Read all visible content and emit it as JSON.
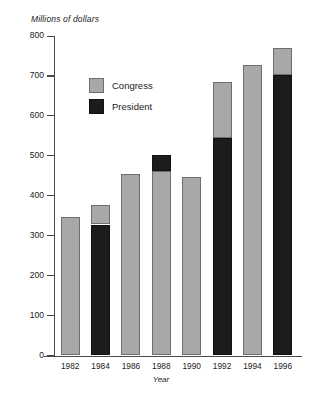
{
  "chart_data": {
    "type": "bar",
    "title": "",
    "subtitle": "",
    "xlabel": "Year",
    "ylabel": "Millions of dollars",
    "ylim": [
      0,
      800
    ],
    "ytick_step": 100,
    "yticks": [
      "800",
      "700",
      "600",
      "500",
      "400",
      "300",
      "200",
      "100",
      "0"
    ],
    "categories": [
      "1982",
      "1984",
      "1986",
      "1988",
      "1990",
      "1992",
      "1994",
      "1996"
    ],
    "stacked": true,
    "grid": false,
    "legend_position": "inside-upper-left",
    "series": [
      {
        "name": "Congress",
        "color": "#a8a8a8",
        "values": [
          346,
          49,
          455,
          463,
          447,
          140,
          727,
          68
        ]
      },
      {
        "name": "President",
        "color": "#1c1c1c",
        "values": [
          0,
          328,
          0,
          39,
          0,
          545,
          0,
          702
        ]
      }
    ],
    "totals": [
      346,
      377,
      455,
      502,
      447,
      685,
      727,
      770
    ],
    "bar_layout": [
      {
        "year": "1982",
        "total": 346,
        "segments": [
          {
            "series": "Congress",
            "from": 0,
            "to": 346
          }
        ]
      },
      {
        "year": "1984",
        "total": 377,
        "segments": [
          {
            "series": "President",
            "from": 0,
            "to": 328
          },
          {
            "series": "Congress",
            "from": 328,
            "to": 377
          }
        ]
      },
      {
        "year": "1986",
        "total": 455,
        "segments": [
          {
            "series": "Congress",
            "from": 0,
            "to": 455
          }
        ]
      },
      {
        "year": "1988",
        "total": 502,
        "segments": [
          {
            "series": "Congress",
            "from": 0,
            "to": 463
          },
          {
            "series": "President",
            "from": 463,
            "to": 502
          }
        ]
      },
      {
        "year": "1990",
        "total": 447,
        "segments": [
          {
            "series": "Congress",
            "from": 0,
            "to": 447
          }
        ]
      },
      {
        "year": "1992",
        "total": 685,
        "segments": [
          {
            "series": "President",
            "from": 0,
            "to": 545
          },
          {
            "series": "Congress",
            "from": 545,
            "to": 685
          }
        ]
      },
      {
        "year": "1994",
        "total": 727,
        "segments": [
          {
            "series": "Congress",
            "from": 0,
            "to": 727
          }
        ]
      },
      {
        "year": "1996",
        "total": 770,
        "segments": [
          {
            "series": "President",
            "from": 0,
            "to": 702
          },
          {
            "series": "Congress",
            "from": 702,
            "to": 770
          }
        ]
      }
    ]
  },
  "legend": {
    "items": [
      {
        "label": "Congress",
        "key": "Congress"
      },
      {
        "label": "President",
        "key": "President"
      }
    ]
  }
}
